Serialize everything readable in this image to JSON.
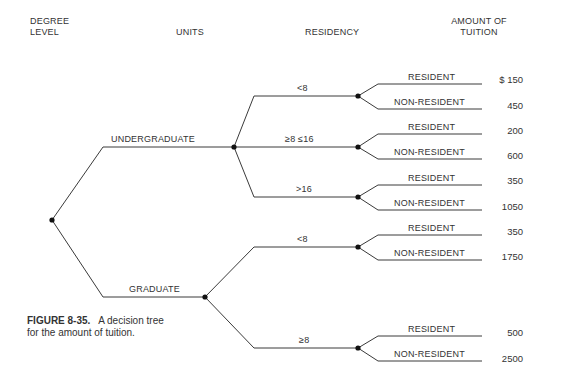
{
  "headers": {
    "degree_level_line1": "DEGREE",
    "degree_level_line2": "LEVEL",
    "units": "UNITS",
    "residency": "RESIDENCY",
    "amount_line1": "AMOUNT OF",
    "amount_line2": "TUITION"
  },
  "tree": {
    "degree_levels": [
      {
        "label": "UNDERGRADUATE",
        "units": [
          {
            "label": "<8",
            "residency": [
              {
                "label": "RESIDENT",
                "amount": "$ 150"
              },
              {
                "label": "NON-RESIDENT",
                "amount": "450"
              }
            ]
          },
          {
            "label": "≥8 ≤16",
            "residency": [
              {
                "label": "RESIDENT",
                "amount": "200"
              },
              {
                "label": "NON-RESIDENT",
                "amount": "600"
              }
            ]
          },
          {
            "label": ">16",
            "residency": [
              {
                "label": "RESIDENT",
                "amount": "350"
              },
              {
                "label": "NON-RESIDENT",
                "amount": "1050"
              }
            ]
          }
        ]
      },
      {
        "label": "GRADUATE",
        "units": [
          {
            "label": "<8",
            "residency": [
              {
                "label": "RESIDENT",
                "amount": "350"
              },
              {
                "label": "NON-RESIDENT",
                "amount": "1750"
              }
            ]
          },
          {
            "label": "≥8",
            "residency": [
              {
                "label": "RESIDENT",
                "amount": "500"
              },
              {
                "label": "NON-RESIDENT",
                "amount": "2500"
              }
            ]
          }
        ]
      }
    ]
  },
  "caption": {
    "figure_label": "FIGURE 8-35.",
    "text": "A decision tree for the amount of tuition."
  },
  "colors": {
    "line": "#3a3a3a",
    "text": "#333333"
  }
}
